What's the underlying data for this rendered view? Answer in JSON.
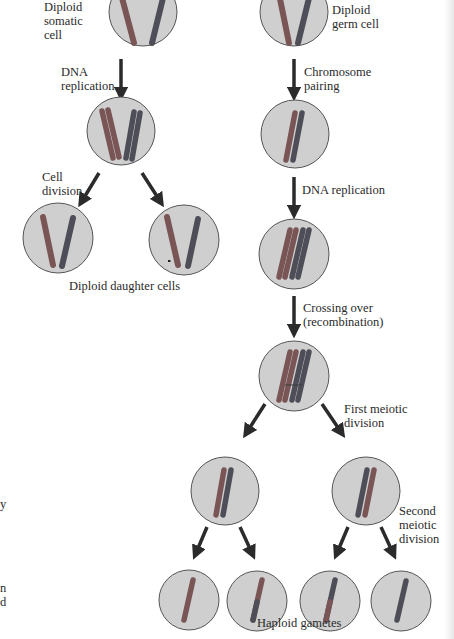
{
  "labels": {
    "diploid_somatic_cell": "Diploid\nsomatic\ncell",
    "dna_replication_left": "DNA\nreplication",
    "cell_division": "Cell\ndivision",
    "diploid_daughter_cells": "Diploid daughter cells",
    "diploid_germ_cell": "Diploid\ngerm cell",
    "chromosome_pairing": "Chromosome\npairing",
    "dna_replication_right": "DNA replication",
    "crossing_over": "Crossing over\n(recombination)",
    "first_meiotic_division": "First meiotic\ndivision",
    "second_meiotic_division": "Second\nmeiotic\ndivision",
    "haploid_gametes": "Haploid gametes"
  },
  "edge_text_fragments": {
    "fragment_1": "y",
    "fragment_2": "n\nd"
  },
  "colors": {
    "cell_fill": "#cfcfcf",
    "cell_stroke": "#555555",
    "chromosome_maternal": "#7a5556",
    "chromosome_paternal": "#4e4e58",
    "arrow": "#2b2b2b"
  },
  "pathways": {
    "mitosis": [
      "Diploid somatic cell",
      "DNA replication",
      "Cell division",
      "Diploid daughter cells"
    ],
    "meiosis": [
      "Diploid germ cell",
      "Chromosome pairing",
      "DNA replication",
      "Crossing over (recombination)",
      "First meiotic division",
      "Second meiotic division",
      "Haploid gametes"
    ]
  }
}
